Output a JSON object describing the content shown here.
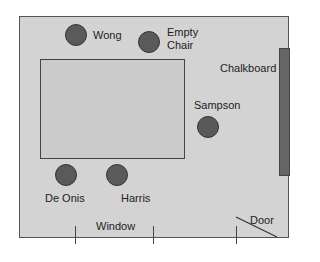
{
  "diagram": {
    "colors": {
      "room": "#d3d3d3",
      "table": "#cbcbcb",
      "chair": "#5a5a5a",
      "chalkboard": "#666666",
      "outline": "#444444"
    },
    "chairs": [
      {
        "label": "Wong"
      },
      {
        "label_line1": "Empty",
        "label_line2": "Chair"
      },
      {
        "label": "Sampson"
      },
      {
        "label": "De Onis"
      },
      {
        "label": "Harris"
      }
    ],
    "chalkboard_label": "Chalkboard",
    "window_label": "Window",
    "door_label": "Door"
  }
}
